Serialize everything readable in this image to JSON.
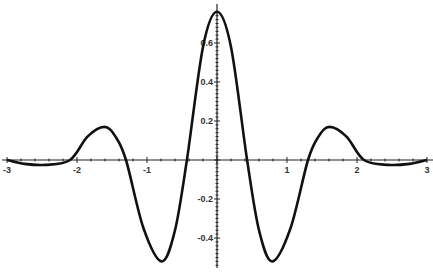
{
  "chart_data": {
    "type": "line",
    "title": "",
    "xlabel": "",
    "ylabel": "",
    "xlim": [
      -3,
      3
    ],
    "ylim": [
      -0.55,
      0.78
    ],
    "grid": false,
    "legend": null,
    "x_ticks": [
      -3,
      -2,
      -1,
      1,
      2,
      3
    ],
    "x_tick_labels": [
      "-3",
      "-2",
      "-1",
      "1",
      "2",
      "3"
    ],
    "y_ticks": [
      0.6,
      0.4,
      0.2,
      -0.2,
      -0.4
    ],
    "y_tick_labels": [
      "0.6",
      "0.4",
      "0.2",
      "-0.2",
      "-0.4"
    ],
    "series": [
      {
        "name": "f(x)",
        "color": "#111111",
        "x": [
          -3.0,
          -2.75,
          -2.45,
          -2.1,
          -1.85,
          -1.61,
          -1.45,
          -1.3,
          -1.05,
          -0.79,
          -0.6,
          -0.43,
          -0.2,
          0.0,
          0.2,
          0.43,
          0.6,
          0.79,
          1.05,
          1.3,
          1.45,
          1.61,
          1.85,
          2.1,
          2.45,
          2.75,
          3.0
        ],
        "values": [
          0.0,
          -0.02,
          -0.025,
          0.0,
          0.12,
          0.17,
          0.12,
          0.0,
          -0.35,
          -0.52,
          -0.36,
          0.0,
          0.58,
          0.76,
          0.58,
          0.0,
          -0.36,
          -0.52,
          -0.35,
          0.0,
          0.12,
          0.17,
          0.12,
          0.0,
          -0.025,
          -0.02,
          0.0
        ]
      }
    ]
  },
  "colors": {
    "axis": "#222222",
    "curve": "#111111",
    "background": "#ffffff"
  }
}
